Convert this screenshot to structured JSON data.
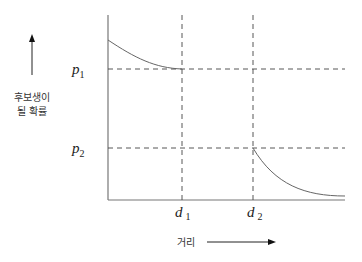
{
  "diagram": {
    "y_axis_label_lines": [
      "후보생이",
      "될 확률"
    ],
    "x_axis_label": "거리",
    "y_ticks": [
      {
        "name": "p",
        "sub": "1"
      },
      {
        "name": "p",
        "sub": "2"
      }
    ],
    "x_ticks": [
      {
        "name": "d",
        "sub": "1"
      },
      {
        "name": "d",
        "sub": "2"
      }
    ],
    "curves": [
      {
        "description": "decreasing curve from y-axis down to p1 at d1"
      },
      {
        "description": "decreasing curve from p2 at d2 toward zero"
      }
    ],
    "line_color": "#555555"
  }
}
